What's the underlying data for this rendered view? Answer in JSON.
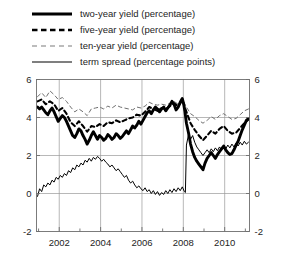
{
  "legend": {
    "items": [
      {
        "label": "two-year yield (percentage)",
        "style": "thick-solid",
        "name": "legend-two-year-yield"
      },
      {
        "label": "five-year yield (percentage)",
        "style": "thick-dashed",
        "name": "legend-five-year-yield"
      },
      {
        "label": "ten-year yield (percentage)",
        "style": "thin-dashed",
        "name": "legend-ten-year-yield"
      },
      {
        "label": "term spread (percentage points)",
        "style": "thin-solid",
        "name": "legend-term-spread"
      }
    ]
  },
  "chart_data": {
    "type": "line",
    "title": "",
    "xlabel": "",
    "ylabel": "",
    "xlim": [
      2000.9,
      2011.2
    ],
    "ylim": [
      -2,
      6
    ],
    "ytick_values": [
      -2,
      0,
      2,
      4,
      6
    ],
    "ytick_labels_left": [
      "-2",
      "0",
      "2",
      "4",
      "6"
    ],
    "ytick_labels_right": [
      "-2",
      "0",
      "2",
      "4",
      "6"
    ],
    "xtick_major_values": [
      2002,
      2004,
      2006,
      2008,
      2010
    ],
    "xtick_major_labels": [
      "2002",
      "2004",
      "2006",
      "2008",
      "2010"
    ],
    "xtick_minor_values": [
      2001,
      2003,
      2005,
      2007,
      2009,
      2011
    ],
    "grid": true,
    "legend_position": "above-plot",
    "colors": {
      "line": "#000000",
      "grid": "#9a9a9a",
      "axis": "#6e6e6e",
      "text": "#242424"
    },
    "series": [
      {
        "name": "two-year yield (percentage)",
        "style": "thick-solid",
        "x": [
          2000.95,
          2001.05,
          2001.15,
          2001.25,
          2001.35,
          2001.45,
          2001.55,
          2001.65,
          2001.75,
          2001.85,
          2001.95,
          2002.05,
          2002.15,
          2002.25,
          2002.35,
          2002.45,
          2002.55,
          2002.65,
          2002.75,
          2002.85,
          2002.95,
          2003.05,
          2003.15,
          2003.25,
          2003.35,
          2003.45,
          2003.55,
          2003.65,
          2003.75,
          2003.85,
          2003.95,
          2004.05,
          2004.15,
          2004.25,
          2004.35,
          2004.45,
          2004.55,
          2004.65,
          2004.75,
          2004.85,
          2004.95,
          2005.05,
          2005.15,
          2005.25,
          2005.35,
          2005.45,
          2005.55,
          2005.65,
          2005.75,
          2005.85,
          2005.95,
          2006.05,
          2006.15,
          2006.25,
          2006.35,
          2006.45,
          2006.55,
          2006.65,
          2006.75,
          2006.85,
          2006.95,
          2007.05,
          2007.15,
          2007.25,
          2007.35,
          2007.45,
          2007.55,
          2007.65,
          2007.75,
          2007.85,
          2007.95,
          2008.02,
          2008.08,
          2008.15,
          2008.25,
          2008.35,
          2008.45,
          2008.55,
          2008.65,
          2008.75,
          2008.85,
          2008.95,
          2009.05,
          2009.15,
          2009.25,
          2009.35,
          2009.45,
          2009.55,
          2009.65,
          2009.75,
          2009.85,
          2009.95,
          2010.05,
          2010.15,
          2010.25,
          2010.35,
          2010.45,
          2010.55,
          2010.65,
          2010.75,
          2010.85,
          2010.95,
          2011.05,
          2011.15
        ],
        "y": [
          4.55,
          4.45,
          4.55,
          4.4,
          4.25,
          4.15,
          4.35,
          4.5,
          4.3,
          4.05,
          3.8,
          3.95,
          4.1,
          4.0,
          3.8,
          3.55,
          3.3,
          3.05,
          2.95,
          3.15,
          3.4,
          3.3,
          3.05,
          2.85,
          2.6,
          2.8,
          3.05,
          3.25,
          3.05,
          2.85,
          3.05,
          2.95,
          2.8,
          2.9,
          3.1,
          3.0,
          2.85,
          2.95,
          3.15,
          3.05,
          2.9,
          3.0,
          3.15,
          3.3,
          3.15,
          3.35,
          3.55,
          3.45,
          3.6,
          3.8,
          3.65,
          3.85,
          4.05,
          4.25,
          4.35,
          4.2,
          4.4,
          4.55,
          4.45,
          4.3,
          4.45,
          4.55,
          4.35,
          4.5,
          4.65,
          4.85,
          4.7,
          4.4,
          4.55,
          4.8,
          5.0,
          4.7,
          4.3,
          3.7,
          3.2,
          2.6,
          2.2,
          1.9,
          1.7,
          1.55,
          1.4,
          1.25,
          1.6,
          1.85,
          2.0,
          2.15,
          2.0,
          1.85,
          2.05,
          2.2,
          2.35,
          2.5,
          2.3,
          2.15,
          2.05,
          2.1,
          2.3,
          2.55,
          2.75,
          3.05,
          3.35,
          3.6,
          3.85,
          3.95
        ]
      },
      {
        "name": "five-year yield (percentage)",
        "style": "thick-dashed",
        "x": [
          2000.95,
          2001.15,
          2001.35,
          2001.55,
          2001.75,
          2001.95,
          2002.15,
          2002.35,
          2002.55,
          2002.75,
          2002.95,
          2003.15,
          2003.35,
          2003.55,
          2003.75,
          2003.95,
          2004.15,
          2004.35,
          2004.55,
          2004.75,
          2004.95,
          2005.15,
          2005.35,
          2005.55,
          2005.75,
          2005.95,
          2006.15,
          2006.35,
          2006.55,
          2006.75,
          2006.95,
          2007.15,
          2007.35,
          2007.55,
          2007.75,
          2007.95,
          2008.15,
          2008.35,
          2008.55,
          2008.75,
          2008.95,
          2009.15,
          2009.35,
          2009.55,
          2009.75,
          2009.95,
          2010.15,
          2010.35,
          2010.55,
          2010.75,
          2010.95,
          2011.15
        ],
        "y": [
          4.85,
          4.95,
          4.7,
          4.85,
          4.7,
          4.35,
          4.5,
          4.2,
          3.75,
          3.55,
          3.8,
          3.55,
          3.25,
          3.55,
          3.5,
          3.65,
          3.55,
          3.75,
          3.7,
          3.85,
          3.75,
          3.85,
          3.95,
          4.0,
          4.15,
          4.1,
          4.3,
          4.55,
          4.45,
          4.35,
          4.5,
          4.45,
          4.6,
          4.75,
          4.6,
          4.9,
          4.3,
          3.7,
          3.35,
          3.05,
          2.8,
          3.05,
          3.3,
          3.15,
          3.4,
          3.55,
          3.3,
          3.15,
          3.2,
          3.45,
          3.7,
          3.9
        ]
      },
      {
        "name": "ten-year yield (percentage)",
        "style": "thin-dashed",
        "x": [
          2000.95,
          2001.15,
          2001.35,
          2001.55,
          2001.75,
          2001.95,
          2002.15,
          2002.35,
          2002.55,
          2002.75,
          2002.95,
          2003.15,
          2003.35,
          2003.55,
          2003.75,
          2003.95,
          2004.15,
          2004.35,
          2004.55,
          2004.75,
          2004.95,
          2005.15,
          2005.35,
          2005.55,
          2005.75,
          2005.95,
          2006.15,
          2006.35,
          2006.55,
          2006.75,
          2006.95,
          2007.15,
          2007.35,
          2007.55,
          2007.75,
          2007.95,
          2008.15,
          2008.35,
          2008.55,
          2008.75,
          2008.95,
          2009.15,
          2009.35,
          2009.55,
          2009.75,
          2009.95,
          2010.15,
          2010.35,
          2010.55,
          2010.75,
          2010.95,
          2011.15
        ],
        "y": [
          5.1,
          5.3,
          5.05,
          5.4,
          5.2,
          4.95,
          5.05,
          4.85,
          4.55,
          4.3,
          4.45,
          4.3,
          4.1,
          4.45,
          4.5,
          4.55,
          4.45,
          4.6,
          4.5,
          4.65,
          4.55,
          4.5,
          4.45,
          4.4,
          4.55,
          4.5,
          4.6,
          4.8,
          4.7,
          4.65,
          4.7,
          4.65,
          4.75,
          4.85,
          4.7,
          4.95,
          4.55,
          4.2,
          4.05,
          3.85,
          3.7,
          3.85,
          4.05,
          3.9,
          4.1,
          4.2,
          4.05,
          3.9,
          3.95,
          4.15,
          4.35,
          4.45
        ]
      },
      {
        "name": "term spread (percentage points)",
        "style": "thin-solid",
        "x": [
          2000.95,
          2001.05,
          2001.15,
          2001.25,
          2001.35,
          2001.45,
          2001.55,
          2001.65,
          2001.75,
          2001.85,
          2001.95,
          2002.05,
          2002.15,
          2002.25,
          2002.35,
          2002.45,
          2002.55,
          2002.65,
          2002.75,
          2002.85,
          2002.95,
          2003.05,
          2003.15,
          2003.25,
          2003.35,
          2003.45,
          2003.55,
          2003.65,
          2003.75,
          2003.85,
          2003.95,
          2004.05,
          2004.15,
          2004.25,
          2004.35,
          2004.45,
          2004.55,
          2004.65,
          2004.75,
          2004.85,
          2004.95,
          2005.05,
          2005.15,
          2005.25,
          2005.35,
          2005.45,
          2005.55,
          2005.65,
          2005.75,
          2005.85,
          2005.95,
          2006.05,
          2006.15,
          2006.25,
          2006.35,
          2006.45,
          2006.55,
          2006.65,
          2006.75,
          2006.85,
          2006.95,
          2007.05,
          2007.15,
          2007.25,
          2007.35,
          2007.45,
          2007.55,
          2007.65,
          2007.75,
          2007.85,
          2007.95,
          2008.05,
          2008.1,
          2008.15,
          2008.25,
          2008.35,
          2008.45,
          2008.55,
          2008.65,
          2008.75,
          2008.85,
          2008.95,
          2009.05,
          2009.15,
          2009.25,
          2009.35,
          2009.45,
          2009.55,
          2009.65,
          2009.75,
          2009.85,
          2009.95,
          2010.05,
          2010.15,
          2010.25,
          2010.35,
          2010.45,
          2010.55,
          2010.65,
          2010.75,
          2010.85,
          2010.95,
          2011.05,
          2011.15
        ],
        "y": [
          -0.15,
          0.25,
          0.1,
          0.45,
          0.35,
          0.55,
          0.45,
          0.7,
          0.6,
          0.85,
          0.75,
          0.95,
          0.85,
          1.05,
          0.95,
          1.2,
          1.1,
          1.35,
          1.25,
          1.5,
          1.4,
          1.6,
          1.5,
          1.75,
          1.65,
          1.85,
          1.7,
          1.9,
          1.8,
          1.95,
          1.85,
          1.7,
          1.8,
          1.65,
          1.55,
          1.4,
          1.5,
          1.35,
          1.2,
          1.3,
          1.15,
          1.0,
          0.85,
          0.95,
          0.7,
          0.55,
          0.65,
          0.45,
          0.3,
          0.4,
          0.25,
          0.15,
          0.3,
          0.1,
          0.2,
          0.0,
          0.15,
          -0.05,
          0.1,
          -0.1,
          0.05,
          -0.05,
          0.15,
          0.0,
          0.2,
          0.05,
          0.25,
          0.1,
          0.3,
          0.15,
          0.35,
          0.1,
          0.05,
          2.55,
          3.1,
          2.85,
          3.05,
          2.7,
          2.45,
          2.3,
          2.15,
          2.0,
          2.15,
          2.3,
          2.15,
          2.35,
          2.2,
          2.4,
          2.25,
          2.45,
          2.3,
          2.5,
          2.35,
          2.55,
          2.4,
          2.6,
          2.45,
          2.65,
          2.5,
          2.7,
          2.55,
          2.75,
          2.6,
          2.7
        ]
      }
    ]
  }
}
